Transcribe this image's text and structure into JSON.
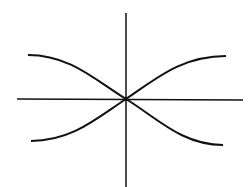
{
  "diagram": {
    "type": "axes-with-crossing-curves",
    "stroke_color": "#111111",
    "background": "#ffffff",
    "origin": [
      126,
      99
    ],
    "axes": {
      "horizontal": {
        "from": [
          17,
          99
        ],
        "to": [
          243,
          100
        ]
      },
      "vertical": {
        "from": [
          126,
          13
        ],
        "to": [
          126,
          187
        ]
      }
    },
    "curves": [
      {
        "name": "decreasing-curve",
        "start": [
          28,
          55
        ],
        "end": [
          223,
          145
        ]
      },
      {
        "name": "increasing-curve",
        "start": [
          31,
          141
        ],
        "end": [
          226,
          56
        ]
      }
    ]
  }
}
